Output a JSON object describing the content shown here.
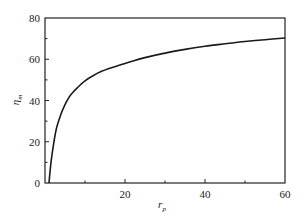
{
  "chart_data": {
    "type": "line",
    "title": "",
    "xlabel": "r_p",
    "xlabel_main": "r",
    "xlabel_sub": "p",
    "ylabel": "η_m",
    "ylabel_main": "η",
    "ylabel_sub": "m",
    "xlim": [
      0,
      60
    ],
    "ylim": [
      0,
      80
    ],
    "x_ticks": [
      0,
      20,
      40,
      60
    ],
    "x_tick_labels": [
      "20",
      "40",
      "60"
    ],
    "x_minor_ticks": [
      10,
      30,
      50
    ],
    "y_ticks": [
      0,
      20,
      40,
      60,
      80
    ],
    "y_tick_labels": [
      "0",
      "20",
      "40",
      "60",
      "80"
    ],
    "y_minor_ticks": [
      10,
      30,
      50,
      70
    ],
    "grid": false,
    "legend": null,
    "series": [
      {
        "name": "η_m vs r_p",
        "color": "#1a1a1a",
        "x": [
          1,
          1.5,
          2,
          2.5,
          3,
          4,
          5,
          6,
          7,
          8,
          10,
          12,
          14,
          16,
          20,
          25,
          30,
          35,
          40,
          45,
          50,
          55,
          60
        ],
        "y": [
          0,
          10,
          17,
          23,
          27.5,
          33.5,
          38,
          41.5,
          44,
          46,
          49.5,
          52,
          54,
          55.5,
          58,
          60.8,
          63,
          64.8,
          66.3,
          67.5,
          68.6,
          69.5,
          70.3
        ]
      }
    ]
  }
}
